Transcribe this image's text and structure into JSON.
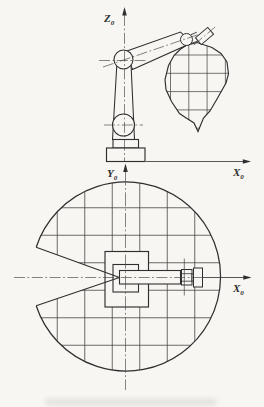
{
  "figure": {
    "ink_color": "#2f2f2f",
    "paper_color": "#f7f6f2"
  },
  "elevation_view": {
    "z_axis_label": {
      "base": "Z",
      "sub": "0"
    },
    "x_axis_label": {
      "base": "X",
      "sub": "0"
    }
  },
  "plan_view": {
    "y_axis_label": {
      "base": "Y",
      "sub": "0"
    },
    "x_axis_label": {
      "base": "X",
      "sub": "0"
    }
  }
}
